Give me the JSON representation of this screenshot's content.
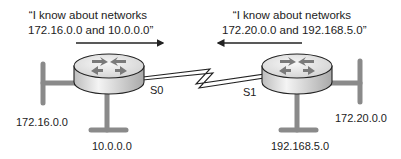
{
  "diagram": {
    "type": "network-topology",
    "routers": [
      {
        "id": "left-router",
        "interface_label": "S0",
        "advertisement": {
          "line1": "“I know about networks",
          "line2": "172.16.0.0 and 10.0.0.0”",
          "direction": "right"
        },
        "networks": [
          {
            "label": "172.16.0.0",
            "side": "left"
          },
          {
            "label": "10.0.0.0",
            "side": "bottom"
          }
        ]
      },
      {
        "id": "right-router",
        "interface_label": "S1",
        "advertisement": {
          "line1": "“I know about networks",
          "line2": "172.20.0.0 and 192.168.5.0”",
          "direction": "left"
        },
        "networks": [
          {
            "label": "172.20.0.0",
            "side": "right"
          },
          {
            "label": "192.168.5.0",
            "side": "bottom"
          }
        ]
      }
    ],
    "link": {
      "type": "serial",
      "icon": "zigzag-serial-link"
    },
    "colors": {
      "network_bar": "#8a8a8a",
      "router_top": "#e6e6e6",
      "router_side": "#cfcfcf",
      "router_arrows": "#7a7a7a",
      "outline": "#222222",
      "text": "#222222"
    }
  }
}
